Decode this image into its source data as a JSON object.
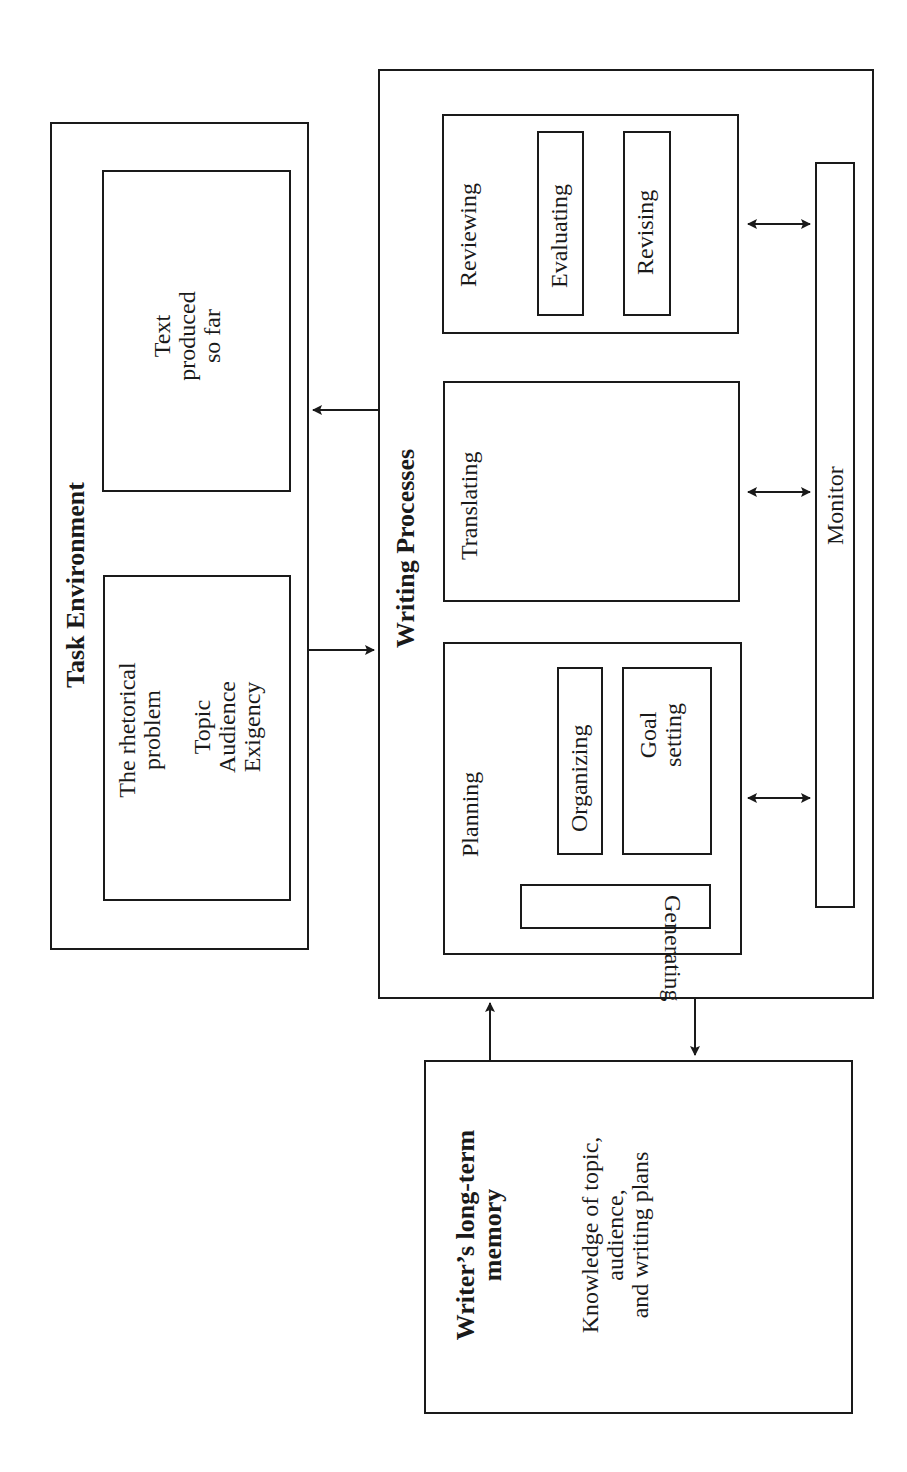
{
  "orientation": "rotated-90-ccw",
  "task_environment": {
    "title": "Task Environment",
    "rhetorical_problem": {
      "title_lines": [
        "The rhetorical",
        "problem"
      ],
      "items": [
        "Topic",
        "Audience",
        "Exigency"
      ]
    },
    "text_produced": {
      "lines": [
        "Text",
        "produced",
        "so far"
      ]
    }
  },
  "writing_processes": {
    "title": "Writing Processes",
    "planning": {
      "title": "Planning",
      "subprocesses": {
        "organizing": "Organizing",
        "goal_setting_lines": [
          "Goal",
          "setting"
        ],
        "generating": "Generating"
      }
    },
    "translating": {
      "title": "Translating"
    },
    "reviewing": {
      "title": "Reviewing",
      "subprocesses": {
        "evaluating": "Evaluating",
        "revising": "Revising"
      }
    },
    "monitor": {
      "title": "Monitor"
    }
  },
  "long_term_memory": {
    "title_lines": [
      "Writer’s long-term",
      "memory"
    ],
    "content_lines": [
      "Knowledge of topic,",
      "audience,",
      "and writing plans"
    ]
  },
  "connections": [
    {
      "from": "task_environment",
      "to": "writing_processes",
      "type": "one-way"
    },
    {
      "from": "writing_processes",
      "to": "text_produced",
      "type": "one-way"
    },
    {
      "from": "long_term_memory",
      "to": "writing_processes",
      "type": "one-way"
    },
    {
      "from": "writing_processes",
      "to": "long_term_memory",
      "type": "one-way"
    },
    {
      "from": "planning",
      "to": "monitor",
      "type": "two-way"
    },
    {
      "from": "translating",
      "to": "monitor",
      "type": "two-way"
    },
    {
      "from": "reviewing",
      "to": "monitor",
      "type": "two-way"
    }
  ],
  "colors": {
    "ink": "#1a1a1a",
    "background": "#ffffff"
  }
}
